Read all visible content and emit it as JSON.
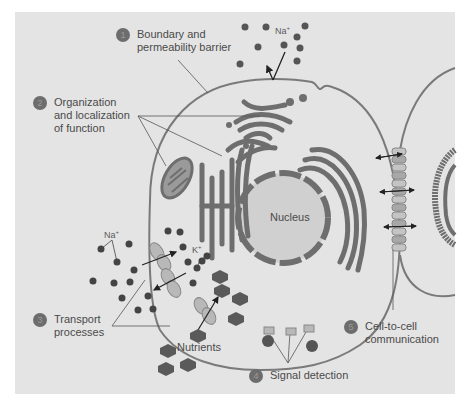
{
  "figure": {
    "labels": [
      {
        "number": "1",
        "text_line1": "Boundary and",
        "text_line2": "permeability barrier"
      },
      {
        "number": "2",
        "text_line1": "Organization",
        "text_line2": "and localization",
        "text_line3": "of function"
      },
      {
        "number": "3",
        "text_line1": "Transport",
        "text_line2": "processes"
      },
      {
        "number": "4",
        "text_line1": "Signal detection"
      },
      {
        "number": "5",
        "text_line1": "Cell-to-cell",
        "text_line2": "communication"
      }
    ],
    "organelles": {
      "nucleus": "Nucleus"
    },
    "ions": {
      "sodium_top": "Na",
      "sodium_top_charge": "+",
      "sodium_left": "Na",
      "sodium_left_charge": "+",
      "potassium": "K",
      "potassium_charge": "+"
    },
    "nutrients": "Nutrients"
  },
  "colors": {
    "background": "#e4e4e4",
    "membrane": "#7a7a7a",
    "organelle": "#6e6e6e",
    "badge": "#6d6d6d",
    "transporter": "#b8b8b8"
  }
}
